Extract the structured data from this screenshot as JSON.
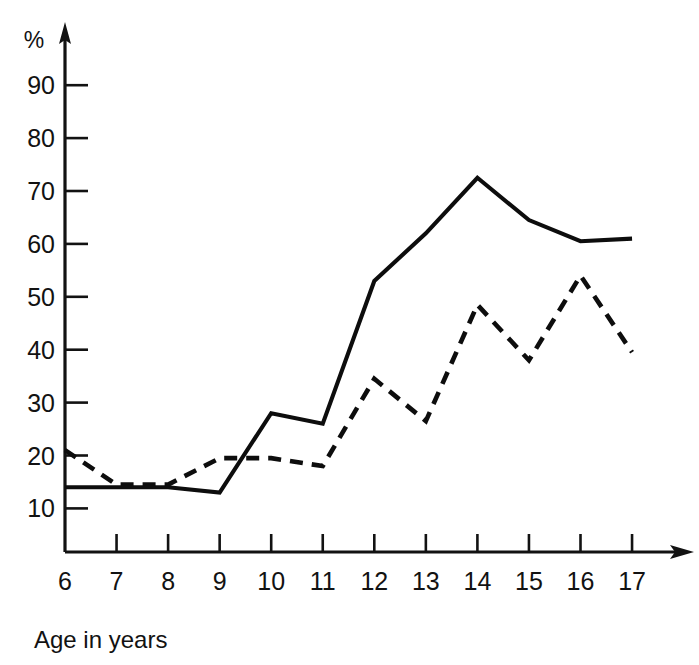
{
  "chart_data": {
    "type": "line",
    "title": "",
    "subtitle": "",
    "xlabel": "Age in years",
    "ylabel": "%",
    "x": [
      6,
      7,
      8,
      9,
      10,
      11,
      12,
      13,
      14,
      15,
      16,
      17
    ],
    "categories": [
      "6",
      "7",
      "8",
      "9",
      "10",
      "11",
      "12",
      "13",
      "14",
      "15",
      "16",
      "17"
    ],
    "series": [
      {
        "name": "solid-series",
        "style": "solid",
        "color": "#0d0d0d",
        "values": [
          14,
          14,
          14,
          13,
          28,
          26,
          53,
          62,
          72.5,
          64.5,
          60.5,
          61
        ]
      },
      {
        "name": "dashed-series",
        "style": "dashed",
        "color": "#0d0d0d",
        "values": [
          21,
          14.5,
          14.5,
          19.5,
          19.5,
          18,
          34.5,
          26.5,
          48.5,
          38,
          54,
          39.5
        ]
      }
    ],
    "xlim": [
      6,
      17
    ],
    "ylim": [
      0,
      95
    ],
    "y_ticks": [
      10,
      20,
      30,
      40,
      50,
      60,
      70,
      80,
      90
    ],
    "y_tick_labels": [
      "10",
      "20",
      "30",
      "40",
      "50",
      "60",
      "70",
      "80",
      "90"
    ],
    "x_ticks": [
      6,
      7,
      8,
      9,
      10,
      11,
      12,
      13,
      14,
      15,
      16,
      17
    ],
    "x_tick_labels": [
      "6",
      "7",
      "8",
      "9",
      "10",
      "11",
      "12",
      "13",
      "14",
      "15",
      "16",
      "17"
    ],
    "grid": false,
    "legend": "none",
    "axis_arrows": true,
    "annotations": []
  },
  "labels": {
    "y_axis_unit": "%",
    "x_axis_caption": "Age in years"
  }
}
